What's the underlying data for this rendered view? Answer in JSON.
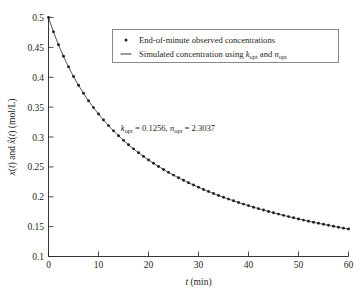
{
  "chart_data": {
    "type": "line",
    "title": "",
    "xlabel": "t (min)",
    "ylabel": "x(t) and x̂(t) (mol/L)",
    "xlim": [
      0,
      60
    ],
    "ylim": [
      0.1,
      0.5
    ],
    "grid": false,
    "legend_position": "top-center",
    "xticks": [
      0,
      10,
      20,
      30,
      40,
      50,
      60
    ],
    "xtick_labels": [
      "0",
      "10",
      "20",
      "30",
      "40",
      "50",
      "60"
    ],
    "yticks": [
      0.1,
      0.15,
      0.2,
      0.25,
      0.3,
      0.35,
      0.4,
      0.45,
      0.5
    ],
    "ytick_labels": [
      "0.1",
      "0.15",
      "0.2",
      "0.25",
      "0.3",
      "0.35",
      "0.4",
      "0.45",
      "0.5"
    ],
    "annotations": [
      {
        "text": "k_opt = 0.1256, n_opt = 2.3037",
        "x": 30,
        "y": 0.305,
        "k_opt": 0.1256,
        "n_opt": 2.3037
      }
    ],
    "series": [
      {
        "name": "End-of-minute observed concentrations",
        "style": "scatter",
        "marker": "dot",
        "color": "#231f20",
        "x": [
          0,
          1,
          2,
          3,
          4,
          5,
          6,
          7,
          8,
          9,
          10,
          11,
          12,
          13,
          14,
          15,
          16,
          17,
          18,
          19,
          20,
          21,
          22,
          23,
          24,
          25,
          26,
          27,
          28,
          29,
          30,
          31,
          32,
          33,
          34,
          35,
          36,
          37,
          38,
          39,
          40,
          41,
          42,
          43,
          44,
          45,
          46,
          47,
          48,
          49,
          50,
          51,
          52,
          53,
          54,
          55,
          56,
          57,
          58,
          59,
          60
        ],
        "values": [
          0.5,
          0.4762,
          0.4555,
          0.4373,
          0.4211,
          0.4065,
          0.3933,
          0.3813,
          0.3702,
          0.3601,
          0.3506,
          0.3419,
          0.3337,
          0.3261,
          0.3189,
          0.3122,
          0.3058,
          0.2998,
          0.2941,
          0.2887,
          0.2835,
          0.2786,
          0.2739,
          0.2695,
          0.2652,
          0.2611,
          0.2571,
          0.2534,
          0.2497,
          0.2462,
          0.2428,
          0.2396,
          0.2364,
          0.2334,
          0.2305,
          0.2276,
          0.2249,
          0.2222,
          0.2196,
          0.2171,
          0.2147,
          0.2123,
          0.21,
          0.2078,
          0.2056,
          0.2035,
          0.2015,
          0.1995,
          0.1975,
          0.1956,
          0.1938,
          0.192,
          0.1902,
          0.1885,
          0.1868,
          0.1852,
          0.1836,
          0.182,
          0.1805,
          0.179,
          0.1776
        ]
      },
      {
        "name": "Simulated concentration using k_opt and n_opt",
        "style": "line",
        "color": "#231f20"
      }
    ],
    "model": {
      "x0": 0.5,
      "k": 0.1256,
      "n": 2.3037,
      "equation": "x(t) = (x0^(1-n) + (n-1)*k*t)^(1/(1-n))"
    }
  },
  "legend": {
    "entries": [
      {
        "marker": "dot",
        "label": "End-of-minute observed concentrations"
      },
      {
        "marker": "line",
        "label_prefix": "Simulated concentration using ",
        "sym1": "k",
        "sub1": "opt",
        "mid": " and ",
        "sym2": "n",
        "sub2": "opt"
      }
    ]
  },
  "annotation": {
    "sym1": "k",
    "sub1": "opt",
    "eq1": " = 0.1256, ",
    "sym2": "n",
    "sub2": "opt",
    "eq2": " = 2.3037"
  },
  "axes": {
    "x_label_sym": "t",
    "x_label_unit": " (min)",
    "y_label_parts": {
      "s1": "x",
      "p1": "(",
      "it1": "t",
      "p2": ") and ",
      "s2": "x̂",
      "p3": "(",
      "it2": "t",
      "p4": ") (mol/L)"
    }
  }
}
